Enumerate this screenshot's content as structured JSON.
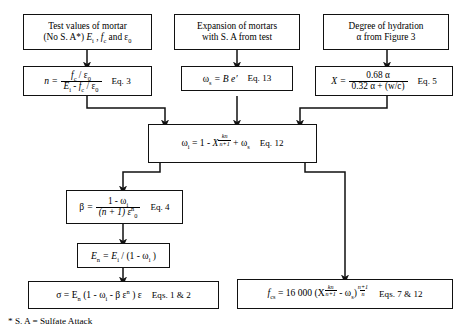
{
  "figure": {
    "type": "flowchart",
    "footnote": "* S. A = Sulfate Attack"
  },
  "nodes": {
    "test_values": {
      "line1": "Test values of mortar",
      "line2_a": "(No S. A*) ",
      "line2_b": "E",
      "line2_isub": "i",
      "line2_c": " , ",
      "line2_d": "f",
      "line2_csub": "c",
      "line2_e": " and ε",
      "line2_zero": "0"
    },
    "expansion": {
      "line1": "Expansion of mortars",
      "line2": "with S. A from test"
    },
    "hydration": {
      "line1": "Degree of hydration",
      "line2": "α from Figure 3"
    },
    "eq3": {
      "lhs": "n",
      "eq": "=",
      "num_f": "f",
      "num_fsub": "c",
      "num_rest": " / ε",
      "num_zero": "0",
      "den_E": "E",
      "den_Esub": "i",
      "den_mid": " - ",
      "den_f": "f",
      "den_fsub": "c",
      "den_rest": " / ε",
      "den_zero": "0",
      "tag": "Eq. 3"
    },
    "eq13": {
      "lhs": "ω",
      "lhs_sub": "s",
      "body": " = B e′",
      "tag": "Eq. 13"
    },
    "eq5": {
      "lhs": "X",
      "eq": "=",
      "num": "0.68 α",
      "den": "0.32 α + (w/c)",
      "tag": "Eq. 5"
    },
    "eq12": {
      "lhs": "ω",
      "lhs_sub": "i",
      "mid": " = 1 - ",
      "base": "X",
      "exp_num": "kn",
      "exp_den": "n+1",
      "tail": " + ω",
      "tail_sub": "s",
      "tag": "Eq. 12"
    },
    "eq4": {
      "lhs": "β",
      "eq": "=",
      "num_a": "1 - ω",
      "num_sub": "i",
      "den_a": "(n + 1) ε",
      "den_sup": "n",
      "den_sub": "0",
      "tag": "Eq. 4"
    },
    "en": {
      "lhs": "E",
      "lhs_sub": "n",
      "mid": " = E",
      "mid_sub": "i",
      "tail": " / (1 - ω",
      "tail_sub": "i",
      "close": " )"
    },
    "sigma": {
      "lhs": "σ = E",
      "lhs_sub": "n",
      "mid": " (1 - ω",
      "mid_sub": "i",
      "mid2": " - β ε",
      "sup": "n",
      "tail": " ) ε",
      "tag": "Eqs. 1 & 2"
    },
    "fcs": {
      "lhs": "f",
      "lhs_sub": "cs",
      "mid": " = 16 000 (X",
      "exp1_num": "kn",
      "exp1_den": "n+1",
      "mid2": " - ω",
      "mid2_sub": "s",
      "close": ")",
      "exp2_num": "n+1",
      "exp2_den": "n",
      "tag": "Eqs. 7 & 12"
    }
  },
  "colors": {
    "line": "#111111",
    "background": "#ffffff"
  }
}
